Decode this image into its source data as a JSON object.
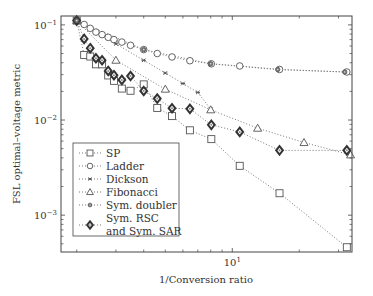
{
  "chart_data": {
    "type": "line",
    "title": "",
    "xlabel": "1/Conversion ratio",
    "ylabel": "FSL optimal–voltage metric",
    "xscale": "log",
    "yscale": "log",
    "xlim": [
      1.7,
      34.5
    ],
    "ylim": [
      0.00041,
      0.124
    ],
    "x_ticks_major": [
      {
        "value": 10,
        "label_base": "10",
        "label_exp": "1"
      }
    ],
    "x_ticks_minor": [
      2,
      3,
      4,
      5,
      6,
      7,
      8,
      9,
      20,
      30
    ],
    "y_ticks_major": [
      {
        "value": 0.1,
        "label_base": "10",
        "label_exp": "−1"
      },
      {
        "value": 0.01,
        "label_base": "10",
        "label_exp": "−2"
      },
      {
        "value": 0.001,
        "label_base": "10",
        "label_exp": "−3"
      }
    ],
    "y_ticks_minor": [
      0.09,
      0.08,
      0.07,
      0.06,
      0.05,
      0.04,
      0.03,
      0.02,
      0.009,
      0.008,
      0.007,
      0.006,
      0.005,
      0.004,
      0.003,
      0.002,
      0.0009,
      0.0008,
      0.0007,
      0.0006,
      0.0005
    ],
    "grid": false,
    "legend_position": "bottom-left",
    "series": [
      {
        "name": "SP",
        "marker": "square",
        "x": [
          2,
          2.16,
          2.3,
          2.44,
          2.6,
          2.77,
          2.94,
          3.19,
          3.49,
          4.0,
          4.6,
          5.36,
          6.45,
          8.05,
          10.8,
          16.3,
          32.7
        ],
        "y": [
          0.111,
          0.0483,
          0.0465,
          0.0385,
          0.0385,
          0.0294,
          0.0258,
          0.0214,
          0.0203,
          0.0237,
          0.0134,
          0.011,
          0.0078,
          0.0063,
          0.0033,
          0.0017,
          0.00046
        ]
      },
      {
        "name": "Ladder",
        "marker": "circle",
        "x": [
          2,
          2.16,
          2.3,
          2.44,
          2.6,
          2.77,
          2.94,
          3.19,
          3.49,
          4.0,
          4.6,
          5.36,
          6.45,
          8.05,
          10.8,
          16.3,
          32.7
        ],
        "y": [
          0.111,
          0.101,
          0.092,
          0.084,
          0.079,
          0.074,
          0.07,
          0.066,
          0.061,
          0.055,
          0.05,
          0.046,
          0.042,
          0.039,
          0.037,
          0.034,
          0.032
        ]
      },
      {
        "name": "Dickson",
        "marker": "x",
        "x": [
          2,
          3,
          4,
          5,
          6,
          7,
          8
        ],
        "y": [
          0.111,
          0.0632,
          0.0424,
          0.0312,
          0.0242,
          0.0195,
          0.013
        ]
      },
      {
        "name": "Fibonacci",
        "marker": "triangle",
        "x": [
          2,
          3,
          5,
          8,
          13,
          21,
          34
        ],
        "y": [
          0.111,
          0.0425,
          0.0211,
          0.0128,
          0.0082,
          0.0058,
          0.0043
        ]
      },
      {
        "name": "Sym. doubler",
        "marker": "star",
        "x": [
          2,
          4,
          8,
          16,
          32
        ],
        "y": [
          0.111,
          0.055,
          0.039,
          0.034,
          0.032
        ]
      },
      {
        "name": "Sym. RSC\nand Sym. SAR",
        "marker": "diamond",
        "x": [
          2,
          2.16,
          2.3,
          2.44,
          2.6,
          2.77,
          2.94,
          3.19,
          3.49,
          4.0,
          4.6,
          5.36,
          6.45,
          8.05,
          10.8,
          16.3,
          32.7
        ],
        "y": [
          0.111,
          0.0712,
          0.0569,
          0.0446,
          0.0425,
          0.0328,
          0.0296,
          0.0264,
          0.029,
          0.0202,
          0.0168,
          0.0133,
          0.0131,
          0.0089,
          0.0075,
          0.0048,
          0.0048
        ]
      }
    ],
    "legend": [
      {
        "label_lines": [
          "SP"
        ],
        "marker": "square"
      },
      {
        "label_lines": [
          "Ladder"
        ],
        "marker": "circle"
      },
      {
        "label_lines": [
          "Dickson"
        ],
        "marker": "x"
      },
      {
        "label_lines": [
          "Fibonacci"
        ],
        "marker": "triangle"
      },
      {
        "label_lines": [
          "Sym. doubler"
        ],
        "marker": "star"
      },
      {
        "label_lines": [
          "Sym. RSC",
          "and Sym. SAR"
        ],
        "marker": "diamond"
      }
    ],
    "colors": {
      "axis": "#444444",
      "marker": "#555555",
      "line": "#777777",
      "text": "#333333"
    }
  }
}
